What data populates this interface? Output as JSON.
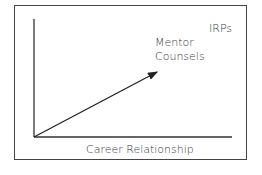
{
  "diagram": {
    "labels": {
      "top_right": "IRPs",
      "arrow_label_line1": "Mentor",
      "arrow_label_line2": "Counsels",
      "x_axis": "Career Relationship"
    },
    "arrow": {
      "from": [
        34,
        137
      ],
      "to": [
        158,
        71
      ]
    },
    "colors": {
      "line": "#222222",
      "text": "#3a3a3a",
      "frame": "#444444"
    }
  }
}
